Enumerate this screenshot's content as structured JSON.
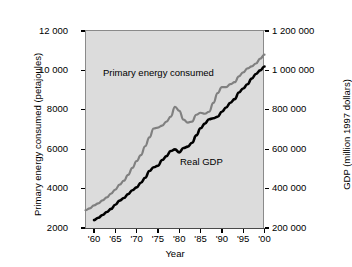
{
  "chart_data": {
    "type": "line",
    "title": "",
    "xlabel": "Year",
    "ylabel": "Primary energy consumed (petajoules)",
    "ylabel_right": "GDP (million 1997 dollars)",
    "grid": false,
    "legend_position": "inline-annotation",
    "background": "#dcdcdc",
    "xlim": [
      1958,
      2000
    ],
    "ylim": [
      2000,
      12000
    ],
    "ylim_right": [
      200000,
      1200000
    ],
    "xticks": [
      "'60",
      "'65",
      "'70",
      "'75",
      "'80",
      "'85",
      "'90",
      "'95",
      "'00"
    ],
    "xtick_values": [
      1960,
      1965,
      1970,
      1975,
      1980,
      1985,
      1990,
      1995,
      2000
    ],
    "yticks_left": [
      "2000",
      "4000",
      "6000",
      "8000",
      "10 000",
      "12 000"
    ],
    "ytick_values_left": [
      2000,
      4000,
      6000,
      8000,
      10000,
      12000
    ],
    "yticks_right": [
      "200 000",
      "400 000",
      "600 000",
      "800 000",
      "1 000 000",
      "1 200 000"
    ],
    "ytick_values_right": [
      200000,
      400000,
      600000,
      800000,
      1000000,
      1200000
    ],
    "x": [
      1958,
      1959,
      1960,
      1961,
      1962,
      1963,
      1964,
      1965,
      1966,
      1967,
      1968,
      1969,
      1970,
      1971,
      1972,
      1973,
      1974,
      1975,
      1976,
      1977,
      1978,
      1979,
      1980,
      1981,
      1982,
      1983,
      1984,
      1985,
      1986,
      1987,
      1988,
      1989,
      1990,
      1991,
      1992,
      1993,
      1994,
      1995,
      1996,
      1997,
      1998,
      1999,
      2000
    ],
    "series": [
      {
        "name": "Primary energy consumed",
        "color": "#808080",
        "axis": "left",
        "units": "petajoules",
        "values": [
          2900,
          3000,
          3150,
          3250,
          3400,
          3550,
          3750,
          3950,
          4200,
          4400,
          4700,
          5050,
          5400,
          5700,
          6150,
          6600,
          7050,
          7100,
          7200,
          7400,
          7650,
          8150,
          7950,
          7500,
          7350,
          7400,
          7750,
          7850,
          7800,
          7900,
          8350,
          8850,
          9150,
          9150,
          9300,
          9400,
          9700,
          9900,
          10100,
          10200,
          10350,
          10600,
          10800
        ]
      },
      {
        "name": "Real GDP",
        "color": "#000000",
        "axis": "right",
        "units": "million 1997 dollars",
        "values": [
          null,
          null,
          240000,
          252000,
          266000,
          281000,
          297000,
          318000,
          339000,
          352000,
          372000,
          392000,
          406000,
          430000,
          455000,
          489000,
          508000,
          516000,
          545000,
          565000,
          591000,
          599000,
          584000,
          606000,
          613000,
          633000,
          670000,
          706000,
          730000,
          752000,
          757000,
          765000,
          790000,
          812000,
          836000,
          854000,
          888000,
          908000,
          930000,
          958000,
          982000,
          1000000,
          1020000
        ]
      }
    ],
    "annotations": [
      {
        "text": "Primary energy consumed",
        "x": 1964,
        "y": 10400
      },
      {
        "text": "Real GDP",
        "x": 1986,
        "y": 5700
      }
    ]
  },
  "axes": {
    "x_title": "Year",
    "y_left_title": "Primary energy consumed (petajoules)",
    "y_right_title": "GDP (million 1997 dollars)"
  }
}
